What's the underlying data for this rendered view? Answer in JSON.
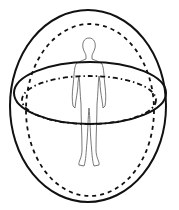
{
  "diagram": {
    "stroke_color": "#111111",
    "figure_color": "#555555",
    "elements": [
      {
        "name": "outer-sphere",
        "style": "solid"
      },
      {
        "name": "inner-sphere",
        "style": "dashed"
      },
      {
        "name": "equator-ring-outer",
        "style": "solid"
      },
      {
        "name": "equator-ring-inner",
        "style": "dash-dot"
      },
      {
        "name": "human-figure",
        "style": "outline"
      }
    ]
  }
}
